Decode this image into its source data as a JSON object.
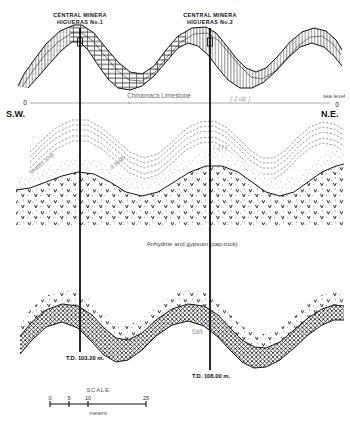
{
  "figure": {
    "title_implicit": "Geologic cross-section S.W. - N.E.",
    "orientation": {
      "left_label": "S.W.",
      "right_label": "N.E."
    },
    "datum": {
      "sea_level_label": "sea level",
      "left_zero": "0",
      "right_zero": "0"
    }
  },
  "wells": [
    {
      "name_line1": "CENTRAL  MINERA",
      "name_line2": "HIGUERAS  No.1",
      "td_label": "T.D. 103.20 m.",
      "x": 80
    },
    {
      "name_line1": "CENTRAL  MINERA",
      "name_line2": "HIGUERAS  No.2",
      "td_label": "T.D. 108.00 m.",
      "x": 210
    }
  ],
  "units": [
    {
      "id": "chinamaca-limestone",
      "label": "Chinamaca Limestone",
      "pattern": "brick-hatch"
    },
    {
      "id": "shales-red-beds",
      "label_part1": "Shales and",
      "label_part2": "red beds",
      "pattern": "dashed-beds"
    },
    {
      "id": "anhydrite-gypsum",
      "label": "Anhydrite and gypsum (cap-rock)",
      "pattern": "dotted-v"
    },
    {
      "id": "salt",
      "label": "Salt",
      "pattern": "cross-hatch"
    }
  ],
  "symbols": [
    {
      "id": "sym-upper",
      "text": "( J ub )"
    },
    {
      "id": "sym-middle",
      "text": "( J l )"
    }
  ],
  "scale": {
    "title": "SCALE",
    "ticks": [
      "0",
      "5",
      "10",
      "25"
    ],
    "unit": "meters"
  },
  "colors": {
    "ink": "#111111",
    "paper": "#ffffff",
    "faint_text": "#8f8f8f",
    "datum_line": "#888888"
  }
}
